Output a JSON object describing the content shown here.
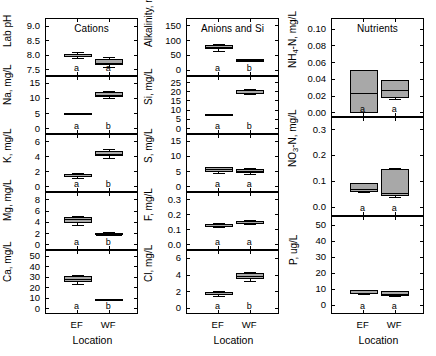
{
  "figure": {
    "width": 436,
    "height": 356,
    "xlabel": "Location",
    "categories": [
      "EF",
      "WF"
    ],
    "box_fill": "#a8a8a8",
    "line_color": "#000000",
    "background": "#ffffff"
  },
  "chart_data": {
    "type": "box",
    "title": "",
    "xlabel": "Location",
    "categories": [
      "EF",
      "WF"
    ],
    "grid": false,
    "legend": null,
    "columns": [
      {
        "column_title": "Cations",
        "panels": [
          {
            "ylabel": "Lab pH",
            "ylabel_plain": "Lab pH",
            "ylim": [
              7.25,
              9.25
            ],
            "yticks": [
              7.5,
              8.0,
              8.5,
              9.0
            ],
            "ytick_labels": [
              "7.5",
              "8.0",
              "8.5",
              "9.0"
            ],
            "boxes": [
              {
                "category": "EF",
                "letter": "a",
                "whisker_low": 7.9,
                "q1": 7.94,
                "median": 8.0,
                "q3": 8.06,
                "whisker_high": 8.1
              },
              {
                "category": "WF",
                "letter": "a",
                "whisker_low": 7.6,
                "q1": 7.68,
                "median": 7.76,
                "q3": 7.88,
                "whisker_high": 7.93
              }
            ]
          },
          {
            "ylabel": "Na, mg/L",
            "ylabel_plain": "Na, mg/L",
            "ylim": [
              -2,
              17
            ],
            "yticks": [
              0,
              5,
              10,
              15
            ],
            "ytick_labels": [
              "0",
              "5",
              "10",
              "15"
            ],
            "boxes": [
              {
                "category": "EF",
                "letter": "a",
                "whisker_low": 4.9,
                "q1": 5.0,
                "median": 5.1,
                "q3": 5.3,
                "whisker_high": 5.4
              },
              {
                "category": "WF",
                "letter": "b",
                "whisker_low": 10.2,
                "q1": 10.5,
                "median": 11.3,
                "q3": 12.2,
                "whisker_high": 12.5
              }
            ]
          },
          {
            "ylabel": "K, mg/L",
            "ylabel_plain": "K, mg/L",
            "ylim": [
              -0.8,
              6.9
            ],
            "yticks": [
              0,
              2,
              4,
              6
            ],
            "ytick_labels": [
              "0",
              "2",
              "4",
              "6"
            ],
            "boxes": [
              {
                "category": "EF",
                "letter": "a",
                "whisker_low": 1.2,
                "q1": 1.3,
                "median": 1.5,
                "q3": 1.7,
                "whisker_high": 1.8
              },
              {
                "category": "WF",
                "letter": "b",
                "whisker_low": 3.9,
                "q1": 4.1,
                "median": 4.4,
                "q3": 4.8,
                "whisker_high": 5.0
              }
            ]
          },
          {
            "ylabel": "Mg, mg/L",
            "ylabel_plain": "Mg, mg/L",
            "ylim": [
              -1.1,
              9.2
            ],
            "yticks": [
              0,
              2,
              4,
              6,
              8
            ],
            "ytick_labels": [
              "0",
              "2",
              "4",
              "6",
              "8"
            ],
            "boxes": [
              {
                "category": "EF",
                "letter": "a",
                "whisker_low": 3.5,
                "q1": 3.8,
                "median": 4.6,
                "q3": 5.0,
                "whisker_high": 5.2
              },
              {
                "category": "WF",
                "letter": "b",
                "whisker_low": 1.7,
                "q1": 1.8,
                "median": 1.9,
                "q3": 2.1,
                "whisker_high": 2.2
              }
            ]
          },
          {
            "ylabel": "Ca, mg/L",
            "ylabel_plain": "Ca, mg/L",
            "ylim": [
              -6,
              55
            ],
            "yticks": [
              0,
              10,
              20,
              30,
              40,
              50
            ],
            "ytick_labels": [
              "0",
              "10",
              "20",
              "30",
              "40",
              "50"
            ],
            "boxes": [
              {
                "category": "EF",
                "letter": "a",
                "whisker_low": 24,
                "q1": 25,
                "median": 29,
                "q3": 31,
                "whisker_high": 32
              },
              {
                "category": "WF",
                "letter": "b",
                "whisker_low": 8.0,
                "q1": 8.4,
                "median": 9.0,
                "q3": 9.6,
                "whisker_high": 10.0
              }
            ]
          }
        ]
      },
      {
        "column_title": "Anions and Si",
        "panels": [
          {
            "ylabel": "Alkalinity, mg/L",
            "ylabel_plain": "Alkalinity, mg/L",
            "ylim": [
              -22,
              172
            ],
            "yticks": [
              0,
              50,
              100,
              150
            ],
            "ytick_labels": [
              "0",
              "50",
              "100",
              "150"
            ],
            "boxes": [
              {
                "category": "EF",
                "letter": "a",
                "whisker_low": 66,
                "q1": 70,
                "median": 79,
                "q3": 86,
                "whisker_high": 90
              },
              {
                "category": "WF",
                "letter": "b",
                "whisker_low": 32,
                "q1": 33,
                "median": 35,
                "q3": 37,
                "whisker_high": 38
              }
            ]
          },
          {
            "ylabel": "Si, mg/L",
            "ylabel_plain": "Si, mg/L",
            "ylim": [
              -3.5,
              28
            ],
            "yticks": [
              0,
              5,
              10,
              15,
              20,
              25
            ],
            "ytick_labels": [
              "0",
              "5",
              "10",
              "15",
              "20",
              "25"
            ],
            "boxes": [
              {
                "category": "EF",
                "letter": "a",
                "whisker_low": 7.2,
                "q1": 7.4,
                "median": 7.7,
                "q3": 8.0,
                "whisker_high": 8.2
              },
              {
                "category": "WF",
                "letter": "b",
                "whisker_low": 18.5,
                "q1": 19.0,
                "median": 19.6,
                "q3": 21.0,
                "whisker_high": 21.5
              }
            ]
          },
          {
            "ylabel": "S, mg/L",
            "ylabel_plain": "S, mg/L",
            "ylim": [
              -2,
              17
            ],
            "yticks": [
              0,
              5,
              10,
              15
            ],
            "ytick_labels": [
              "0",
              "5",
              "10",
              "15"
            ],
            "boxes": [
              {
                "category": "EF",
                "letter": "a",
                "whisker_low": 4.6,
                "q1": 4.9,
                "median": 6.0,
                "q3": 6.4,
                "whisker_high": 6.6
              },
              {
                "category": "WF",
                "letter": "a",
                "whisker_low": 4.3,
                "q1": 4.6,
                "median": 5.4,
                "q3": 6.0,
                "whisker_high": 6.2
              }
            ]
          },
          {
            "ylabel": "F, mg/L",
            "ylabel_plain": "F, mg/L",
            "ylim": [
              -0.04,
              0.345
            ],
            "yticks": [
              0.0,
              0.1,
              0.2,
              0.3
            ],
            "ytick_labels": [
              "0.0",
              "0.1",
              "0.2",
              "0.3"
            ],
            "boxes": [
              {
                "category": "EF",
                "letter": "a",
                "whisker_low": 0.118,
                "q1": 0.122,
                "median": 0.132,
                "q3": 0.142,
                "whisker_high": 0.148
              },
              {
                "category": "WF",
                "letter": "a",
                "whisker_low": 0.138,
                "q1": 0.142,
                "median": 0.152,
                "q3": 0.162,
                "whisker_high": 0.167
              }
            ]
          },
          {
            "ylabel": "Cl, mg/L",
            "ylabel_plain": "Cl, mg/L",
            "ylim": [
              -0.8,
              6.9
            ],
            "yticks": [
              0,
              2,
              4,
              6
            ],
            "ytick_labels": [
              "0",
              "2",
              "4",
              "6"
            ],
            "boxes": [
              {
                "category": "EF",
                "letter": "a",
                "whisker_low": 1.5,
                "q1": 1.6,
                "median": 1.75,
                "q3": 1.95,
                "whisker_high": 2.05
              },
              {
                "category": "WF",
                "letter": "b",
                "whisker_low": 3.3,
                "q1": 3.5,
                "median": 3.95,
                "q3": 4.3,
                "whisker_high": 4.4
              }
            ]
          }
        ]
      },
      {
        "column_title": "Nutrients",
        "panels": [
          {
            "ylabel": "NH4-N, mg/L",
            "ylabel_plain": "NH",
            "ylabel_sub": "4",
            "ylabel_rest": "-N, mg/L",
            "ylim": [
              -0.006,
              0.112
            ],
            "yticks": [
              0.0,
              0.02,
              0.04,
              0.06,
              0.08,
              0.1
            ],
            "ytick_labels": [
              "0.00",
              "0.02",
              "0.04",
              "0.06",
              "0.08",
              "0.10"
            ],
            "boxes": [
              {
                "category": "EF",
                "letter": "a",
                "whisker_low": 0.0,
                "q1": 0.0,
                "median": 0.024,
                "q3": 0.051,
                "whisker_high": 0.051
              },
              {
                "category": "WF",
                "letter": "a",
                "whisker_low": 0.017,
                "q1": 0.018,
                "median": 0.028,
                "q3": 0.039,
                "whisker_high": 0.039
              }
            ]
          },
          {
            "ylabel": "NO3-N, mg/L",
            "ylabel_plain": "NO",
            "ylabel_sub": "3",
            "ylabel_rest": "-N, mg/L",
            "ylim": [
              -0.038,
              0.345
            ],
            "yticks": [
              0.0,
              0.1,
              0.2,
              0.3
            ],
            "ytick_labels": [
              "0.0",
              "0.1",
              "0.2",
              "0.3"
            ],
            "boxes": [
              {
                "category": "EF",
                "letter": "a",
                "whisker_low": 0.057,
                "q1": 0.06,
                "median": 0.072,
                "q3": 0.093,
                "whisker_high": 0.095
              },
              {
                "category": "WF",
                "letter": "a",
                "whisker_low": 0.04,
                "q1": 0.043,
                "median": 0.056,
                "q3": 0.147,
                "whisker_high": 0.15
              }
            ]
          },
          {
            "ylabel": "P, ug/L",
            "ylabel_plain": "P, ug/L",
            "ylim": [
              -6,
              55
            ],
            "yticks": [
              0,
              10,
              20,
              30,
              40,
              50
            ],
            "ytick_labels": [
              "0",
              "10",
              "20",
              "30",
              "40",
              "50"
            ],
            "boxes": [
              {
                "category": "EF",
                "letter": "a",
                "whisker_low": 6.8,
                "q1": 7.2,
                "median": 8.2,
                "q3": 9.3,
                "whisker_high": 9.7
              },
              {
                "category": "WF",
                "letter": "a",
                "whisker_low": 5.6,
                "q1": 6.0,
                "median": 7.4,
                "q3": 8.8,
                "whisker_high": 9.2
              }
            ]
          }
        ]
      }
    ]
  }
}
